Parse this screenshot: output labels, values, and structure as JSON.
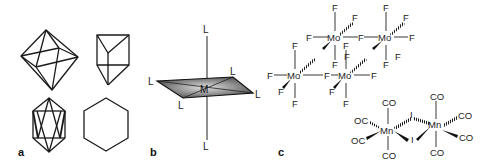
{
  "figure": {
    "panels": [
      {
        "id": "a",
        "label": "a",
        "shapes": [
          "octahedron",
          "trigonal-prism",
          "icosahedron",
          "hexagon"
        ]
      },
      {
        "id": "b",
        "label": "b",
        "structure": "octahedral complex ML6",
        "metal": "M",
        "ligand": "L",
        "ligand_labels": [
          "L",
          "L",
          "L",
          "L",
          "L",
          "L"
        ]
      },
      {
        "id": "c",
        "label": "c",
        "tetramer": {
          "metal": "Mo",
          "ligand": "F",
          "metal_labels": [
            "Mo",
            "Mo",
            "Mo",
            "Mo"
          ]
        },
        "dimer": {
          "metal": "Mn",
          "terminal_ligand": "CO",
          "bridging_ligand": "I",
          "metal_labels": [
            "Mn",
            "Mn"
          ],
          "co_labels": [
            "CO",
            "OC",
            "OC",
            "CO",
            "CO",
            "CO",
            "CO",
            "CO"
          ],
          "bridge_labels": [
            "I",
            "I"
          ]
        }
      }
    ],
    "colors": {
      "line": "#1a1a1a",
      "plane_fill_dark": "#555555",
      "plane_fill_light": "#d8d8d8"
    }
  }
}
